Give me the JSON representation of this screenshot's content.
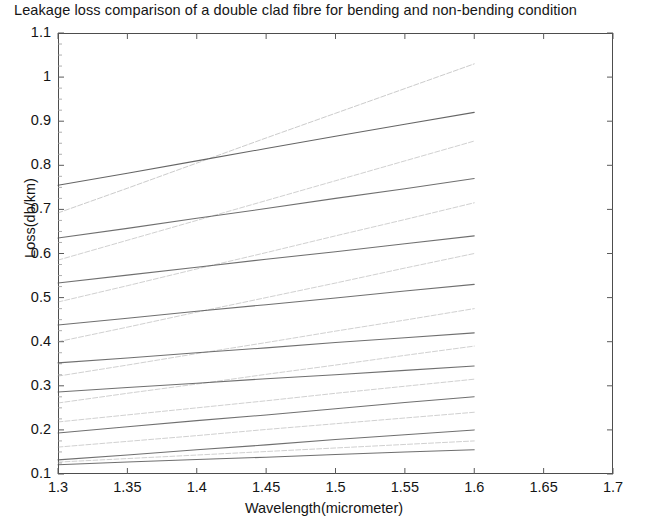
{
  "chart_data": {
    "type": "line",
    "title": "Leakage loss comparison of a double clad fibre for bending and non-bending condition",
    "xlabel": "Wavelength(micrometer)",
    "ylabel": "Loss(db/km)",
    "xlim": [
      1.3,
      1.7
    ],
    "ylim": [
      0.1,
      1.1
    ],
    "xticks": [
      1.3,
      1.35,
      1.4,
      1.45,
      1.5,
      1.55,
      1.6,
      1.65,
      1.7
    ],
    "xtick_labels": [
      "1.3",
      "1.35",
      "1.4",
      "1.45",
      "1.5",
      "1.55",
      "1.6",
      "1.65",
      "1.7"
    ],
    "yticks": [
      0.1,
      0.2,
      0.3,
      0.4,
      0.5,
      0.6,
      0.7,
      0.8,
      0.9,
      1.0,
      1.1
    ],
    "ytick_labels": [
      "0.1",
      "0.2",
      "0.3",
      "0.4",
      "0.5",
      "0.6",
      "0.7",
      "0.8",
      "0.9",
      "1",
      "1.1"
    ],
    "grid": false,
    "legend": "none",
    "x": [
      1.3,
      1.35,
      1.4,
      1.45,
      1.5,
      1.55,
      1.6
    ],
    "series": [
      {
        "name": "bending-1",
        "style": "dashed",
        "color": "#8f8f8f",
        "values": [
          0.692,
          0.748,
          0.805,
          0.862,
          0.918,
          0.974,
          1.03
        ]
      },
      {
        "name": "non-bending-1",
        "style": "solid",
        "color": "#4a4a4a",
        "values": [
          0.755,
          0.782,
          0.81,
          0.838,
          0.866,
          0.893,
          0.92
        ]
      },
      {
        "name": "bending-2",
        "style": "dashed",
        "color": "#9a9a9a",
        "values": [
          0.585,
          0.63,
          0.675,
          0.72,
          0.765,
          0.81,
          0.855
        ]
      },
      {
        "name": "non-bending-2",
        "style": "solid",
        "color": "#565656",
        "values": [
          0.635,
          0.657,
          0.68,
          0.702,
          0.725,
          0.747,
          0.77
        ]
      },
      {
        "name": "bending-3",
        "style": "dashed",
        "color": "#9a9a9a",
        "values": [
          0.49,
          0.527,
          0.565,
          0.602,
          0.64,
          0.677,
          0.715
        ]
      },
      {
        "name": "non-bending-3",
        "style": "solid",
        "color": "#565656",
        "values": [
          0.533,
          0.551,
          0.569,
          0.587,
          0.604,
          0.622,
          0.64
        ]
      },
      {
        "name": "bending-4",
        "style": "dashed",
        "color": "#9a9a9a",
        "values": [
          0.4,
          0.433,
          0.467,
          0.5,
          0.533,
          0.567,
          0.6
        ]
      },
      {
        "name": "non-bending-4",
        "style": "solid",
        "color": "#565656",
        "values": [
          0.438,
          0.453,
          0.469,
          0.484,
          0.499,
          0.515,
          0.53
        ]
      },
      {
        "name": "bending-5",
        "style": "dashed",
        "color": "#9a9a9a",
        "values": [
          0.322,
          0.347,
          0.373,
          0.398,
          0.424,
          0.449,
          0.475
        ]
      },
      {
        "name": "non-bending-5",
        "style": "solid",
        "color": "#565656",
        "values": [
          0.352,
          0.363,
          0.375,
          0.386,
          0.398,
          0.409,
          0.42
        ]
      },
      {
        "name": "bending-6",
        "style": "dashed",
        "color": "#9a9a9a",
        "values": [
          0.261,
          0.283,
          0.304,
          0.326,
          0.347,
          0.369,
          0.39
        ]
      },
      {
        "name": "non-bending-6",
        "style": "solid",
        "color": "#565656",
        "values": [
          0.286,
          0.296,
          0.306,
          0.316,
          0.325,
          0.335,
          0.345
        ]
      },
      {
        "name": "bending-7",
        "style": "dashed",
        "color": "#9a9a9a",
        "values": [
          0.218,
          0.234,
          0.25,
          0.266,
          0.283,
          0.299,
          0.315
        ]
      },
      {
        "name": "non-bending-7",
        "style": "solid",
        "color": "#565656",
        "values": [
          0.193,
          0.207,
          0.221,
          0.234,
          0.248,
          0.262,
          0.275
        ]
      },
      {
        "name": "bending-8",
        "style": "dashed",
        "color": "#9a9a9a",
        "values": [
          0.161,
          0.174,
          0.187,
          0.201,
          0.214,
          0.227,
          0.24
        ]
      },
      {
        "name": "non-bending-8",
        "style": "solid",
        "color": "#565656",
        "values": [
          0.132,
          0.143,
          0.155,
          0.166,
          0.178,
          0.189,
          0.2
        ]
      },
      {
        "name": "bending-9",
        "style": "dashed",
        "color": "#9a9a9a",
        "values": [
          0.127,
          0.135,
          0.143,
          0.151,
          0.159,
          0.167,
          0.175
        ]
      },
      {
        "name": "non-bending-9",
        "style": "solid",
        "color": "#565656",
        "values": [
          0.121,
          0.127,
          0.133,
          0.138,
          0.144,
          0.15,
          0.155
        ]
      }
    ]
  },
  "axes": {
    "title": "Leakage loss comparison of a double clad fibre for bending and non-bending condition",
    "x_axis_label": "Wavelength(micrometer)",
    "y_axis_label": "Loss(db/km)"
  }
}
